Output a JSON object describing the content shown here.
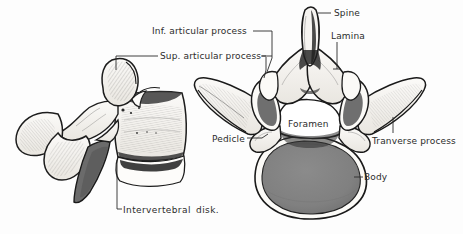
{
  "figure": {
    "background_color": "#fdfdfd",
    "ink_color": "#2b2b2b",
    "body_fill_color": "#808080",
    "shadow_fill_color": "#6b6b6b",
    "bone_fill_color": "#f2f0ec"
  },
  "labels": {
    "inferior_articular_process": "Inf. articular process",
    "superior_articular_process": "Sup. articular process",
    "spine": "Spine",
    "lamina": "Lamina",
    "foramen": "Foramen",
    "pedicle": "Pedicle",
    "transverse_process": "Tranverse process",
    "body": "Body",
    "intervertebral_disk": "Intervertebral  disk."
  },
  "views": {
    "left": {
      "name": "lateral-view",
      "parts": [
        "spinous process",
        "superior articular process",
        "inferior articular process",
        "transverse process",
        "vertebral body",
        "intervertebral disk"
      ]
    },
    "right": {
      "name": "superior-view",
      "parts": [
        "spine",
        "lamina",
        "superior articular process",
        "inferior articular process",
        "pedicle",
        "vertebral foramen",
        "transverse process",
        "vertebral body"
      ]
    }
  }
}
